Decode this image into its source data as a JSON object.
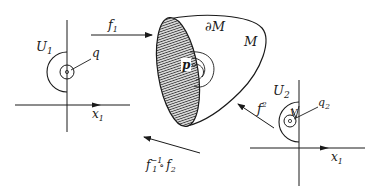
{
  "diagram": {
    "colors": {
      "ink": "#1a1a1a",
      "background": "#ffffff"
    },
    "left_chart": {
      "region_label": "U",
      "region_sub": "1",
      "point_label": "q",
      "axis_label": "x",
      "axis_sub": "1"
    },
    "manifold": {
      "boundary_label": "∂M",
      "manifold_label": "M",
      "point_label": "p"
    },
    "right_chart": {
      "region_label": "U",
      "region_sub": "2",
      "neighborhood_label": "V",
      "point_label": "q",
      "point_sub": "2",
      "axis_label": "x",
      "axis_sub": "1"
    },
    "arrows": {
      "f1": {
        "label": "f",
        "sub": "1"
      },
      "f2": {
        "label": "f",
        "sup": "2"
      },
      "transition": {
        "label": "f",
        "sub": "1",
        "sup": "−1",
        "op": "∘",
        "label2": "f",
        "sub2": "2"
      }
    }
  }
}
